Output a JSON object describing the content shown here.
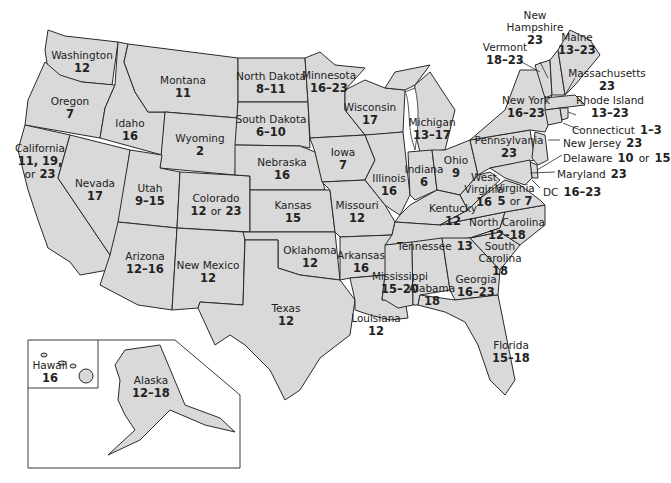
{
  "map": {
    "type": "choropleth-label-map",
    "subject": "United States with per-state ages",
    "fill_color": "#d9d9d9",
    "border_color": "#2a2a2a",
    "background": "#ffffff"
  },
  "states": {
    "washington": {
      "name": "Washington",
      "value": "12"
    },
    "oregon": {
      "name": "Oregon",
      "value": "7"
    },
    "california": {
      "name": "California",
      "value_line1": "11, 19,",
      "value_line2_or": "or",
      "value_line2": "23"
    },
    "idaho": {
      "name": "Idaho",
      "value": "16"
    },
    "nevada": {
      "name": "Nevada",
      "value": "17"
    },
    "montana": {
      "name": "Montana",
      "value": "11"
    },
    "wyoming": {
      "name": "Wyoming",
      "value": "2"
    },
    "utah": {
      "name": "Utah",
      "value": "9–15"
    },
    "colorado": {
      "name": "Colorado",
      "value_a": "12",
      "or": "or",
      "value_b": "23"
    },
    "arizona": {
      "name": "Arizona",
      "value": "12–16"
    },
    "new_mexico": {
      "name": "New Mexico",
      "value": "12"
    },
    "north_dakota": {
      "name": "North Dakota",
      "value": "8–11"
    },
    "south_dakota": {
      "name": "South Dakota",
      "value": "6–10"
    },
    "nebraska": {
      "name": "Nebraska",
      "value": "16"
    },
    "kansas": {
      "name": "Kansas",
      "value": "15"
    },
    "oklahoma": {
      "name": "Oklahoma",
      "value": "12"
    },
    "texas": {
      "name": "Texas",
      "value": "12"
    },
    "minnesota": {
      "name": "Minnesota",
      "value": "16–23"
    },
    "iowa": {
      "name": "Iowa",
      "value": "7"
    },
    "missouri": {
      "name": "Missouri",
      "value": "12"
    },
    "arkansas": {
      "name": "Arkansas",
      "value": "16"
    },
    "louisiana": {
      "name": "Louisiana",
      "value": "12"
    },
    "wisconsin": {
      "name": "Wisconsin",
      "value": "17"
    },
    "illinois": {
      "name": "Illinois",
      "value": "16"
    },
    "michigan": {
      "name": "Michigan",
      "value": "13–17"
    },
    "indiana": {
      "name": "Indiana",
      "value": "6"
    },
    "ohio": {
      "name": "Ohio",
      "value": "9"
    },
    "kentucky": {
      "name": "Kentucky",
      "value": "12"
    },
    "tennessee": {
      "name": "Tennessee",
      "value": "13"
    },
    "mississippi": {
      "name": "Mississippi",
      "value": "15–20"
    },
    "alabama": {
      "name": "Alabama",
      "value": "18"
    },
    "georgia": {
      "name": "Georgia",
      "value": "16–23"
    },
    "florida": {
      "name": "Florida",
      "value": "15–18"
    },
    "south_carolina": {
      "name_line1": "South",
      "name_line2": "Carolina",
      "value": "18"
    },
    "north_carolina": {
      "name": "North Carolina",
      "value": "12–18"
    },
    "virginia": {
      "name": "Virginia",
      "value_a": "5",
      "or": "or",
      "value_b": "7"
    },
    "west_virginia": {
      "name_line1": "West",
      "name_line2": "Virginia",
      "value": "16"
    },
    "pennsylvania": {
      "name": "Pennsylvania",
      "value": "23"
    },
    "new_york": {
      "name": "New York",
      "value": "16–23"
    },
    "vermont": {
      "name": "Vermont",
      "value": "18–23"
    },
    "new_hampshire": {
      "name_line1": "New",
      "name_line2": "Hampshire",
      "value": "23"
    },
    "maine": {
      "name": "Maine",
      "value": "13–23"
    },
    "massachusetts": {
      "name": "Massachusetts",
      "value": "23"
    },
    "rhode_island": {
      "name": "Rhode Island",
      "value": "13–23"
    },
    "connecticut": {
      "name": "Connecticut",
      "value": "1–3"
    },
    "new_jersey": {
      "name": "New Jersey",
      "value": "23"
    },
    "delaware": {
      "name": "Delaware",
      "value_a": "10",
      "or": "or",
      "value_b": "15"
    },
    "maryland": {
      "name": "Maryland",
      "value": "23"
    },
    "dc": {
      "name": "DC",
      "value": "16–23"
    },
    "hawaii": {
      "name": "Hawaii",
      "value": "16"
    },
    "alaska": {
      "name": "Alaska",
      "value": "12–18"
    }
  }
}
